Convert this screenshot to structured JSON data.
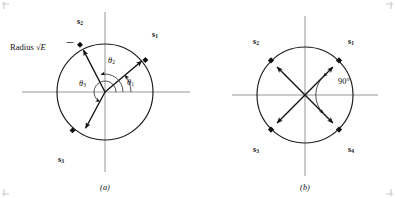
{
  "figure": {
    "caption_a": "(a)",
    "caption_b": "(b)",
    "radius_label_text": "Radius",
    "radius_label_symbol": "√",
    "radius_label_energy": "E",
    "angle_label_b": "90°",
    "colors": {
      "background": "#ffffff",
      "axis": "#8b8b8b",
      "circle": "#1a1a1a",
      "vector": "#111111",
      "arc": "#333333",
      "text": "#111111",
      "corner_tick": "#c9c9c9"
    }
  },
  "panel_a": {
    "name": "signal-space-unequal-angles",
    "center": {
      "x": 105,
      "y": 92
    },
    "radius": 48,
    "vectors": [
      {
        "id": "s1",
        "label_base": "s",
        "label_sub": "1",
        "angle_deg": 40,
        "label_x": 155,
        "label_y": 35
      },
      {
        "id": "s2",
        "label_base": "s",
        "label_sub": "2",
        "angle_deg": 103,
        "label_x": 80,
        "label_y": 22
      },
      {
        "id": "s3",
        "label_base": "s",
        "label_sub": "3",
        "angle_deg": 242,
        "label_x": 61,
        "label_y": 160
      }
    ],
    "angles": [
      {
        "id": "theta1",
        "label_base": "θ",
        "label_sub": "1",
        "start_deg": 0,
        "end_deg": 40,
        "arc_radius": 26,
        "label_x": 129,
        "label_y": 83
      },
      {
        "id": "theta2",
        "label_base": "θ",
        "label_sub": "2",
        "start_deg": 0,
        "end_deg": 103,
        "arc_radius": 18,
        "label_x": 110,
        "label_y": 61
      },
      {
        "id": "theta3",
        "label_base": "θ",
        "label_sub": "3",
        "start_deg": 0,
        "end_deg": 242,
        "arc_radius": 11,
        "label_x": 83,
        "label_y": 84
      }
    ],
    "axis": {
      "x_start": 22,
      "x_end": 190,
      "y_start": 12,
      "y_end": 172
    },
    "caption_x": 105,
    "caption_y": 188
  },
  "panel_b": {
    "name": "signal-space-qpsk-equal-angles",
    "center": {
      "x": 305,
      "y": 95
    },
    "radius": 48,
    "vectors": [
      {
        "id": "s1",
        "label_base": "s",
        "label_sub": "1",
        "angle_deg": 45,
        "label_x": 350,
        "label_y": 42
      },
      {
        "id": "s2",
        "label_base": "s",
        "label_sub": "2",
        "angle_deg": 135,
        "label_x": 257,
        "label_y": 42
      },
      {
        "id": "s3",
        "label_base": "s",
        "label_sub": "3",
        "angle_deg": 225,
        "label_x": 257,
        "label_y": 150
      },
      {
        "id": "s4",
        "label_base": "s",
        "label_sub": "4",
        "angle_deg": 315,
        "label_x": 350,
        "label_y": 150
      }
    ],
    "angle_arc": {
      "start_deg": -45,
      "end_deg": 45,
      "arc_radius": 26,
      "label_x": 344,
      "label_y": 82
    },
    "axis": {
      "x_start": 232,
      "x_end": 378,
      "y_start": 16,
      "y_end": 176
    },
    "caption_x": 305,
    "caption_y": 188
  }
}
